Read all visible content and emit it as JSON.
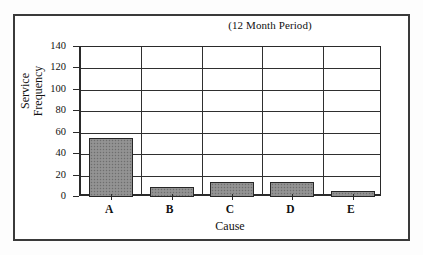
{
  "chart_data": {
    "type": "bar",
    "title": "(12 Month Period)",
    "xlabel": "Cause",
    "ylabel_line1": "Service",
    "ylabel_line2": "Frequency",
    "ylabel": "Service Frequency",
    "categories": [
      "A",
      "B",
      "C",
      "D",
      "E"
    ],
    "values": [
      55,
      9,
      14,
      14,
      6
    ],
    "ylim": [
      0,
      140
    ],
    "yticks": [
      0,
      20,
      40,
      60,
      80,
      100,
      120,
      140
    ],
    "ytick_labels": [
      "0",
      "20",
      "40",
      "60",
      "80",
      "100",
      "120",
      "140"
    ],
    "grid": "horizontal-and-vertical",
    "legend": "none",
    "bar_fill_color": "#8d8d8d",
    "bar_edge_color": "#262626",
    "axis_color": "#2a2a2a",
    "frame_color": "#3a3a3a",
    "background_color": "#ffffff"
  }
}
